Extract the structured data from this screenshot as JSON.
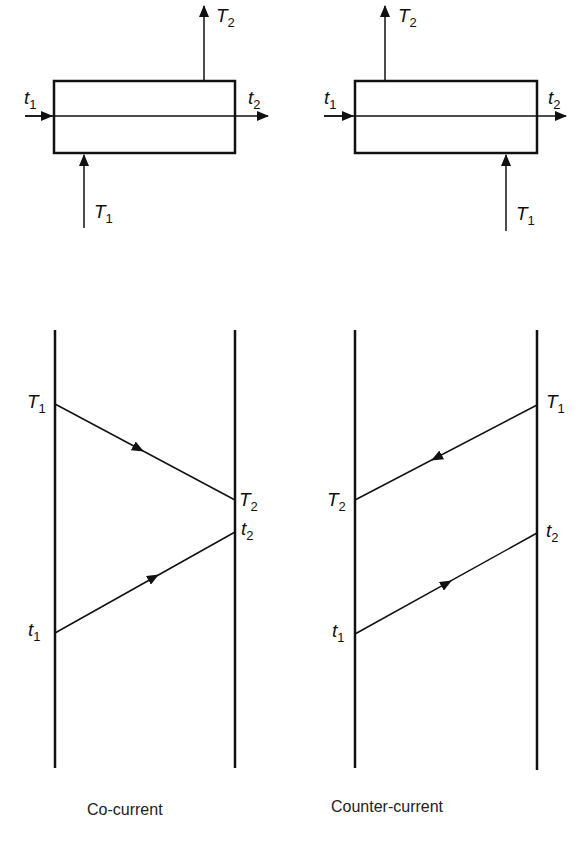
{
  "diagrams": {
    "cocurrent": {
      "caption": "Co-current",
      "top": {
        "inlet_cold": {
          "sym": "t",
          "sub": "1"
        },
        "outlet_cold": {
          "sym": "t",
          "sub": "2"
        },
        "inlet_hot": {
          "sym": "T",
          "sub": "1"
        },
        "outlet_hot": {
          "sym": "T",
          "sub": "2"
        }
      },
      "profile": {
        "hot_in": {
          "sym": "T",
          "sub": "1"
        },
        "hot_out": {
          "sym": "T",
          "sub": "2"
        },
        "cold_in": {
          "sym": "t",
          "sub": "1"
        },
        "cold_out": {
          "sym": "t",
          "sub": "2"
        }
      }
    },
    "countercurrent": {
      "caption": "Counter-current",
      "top": {
        "inlet_cold": {
          "sym": "t",
          "sub": "1"
        },
        "outlet_cold": {
          "sym": "t",
          "sub": "2"
        },
        "inlet_hot": {
          "sym": "T",
          "sub": "1"
        },
        "outlet_hot": {
          "sym": "T",
          "sub": "2"
        }
      },
      "profile": {
        "hot_in": {
          "sym": "T",
          "sub": "1"
        },
        "hot_out": {
          "sym": "T",
          "sub": "2"
        },
        "cold_in": {
          "sym": "t",
          "sub": "1"
        },
        "cold_out": {
          "sym": "t",
          "sub": "2"
        }
      }
    }
  },
  "colors": {
    "line": "#111111",
    "background": "#ffffff"
  }
}
